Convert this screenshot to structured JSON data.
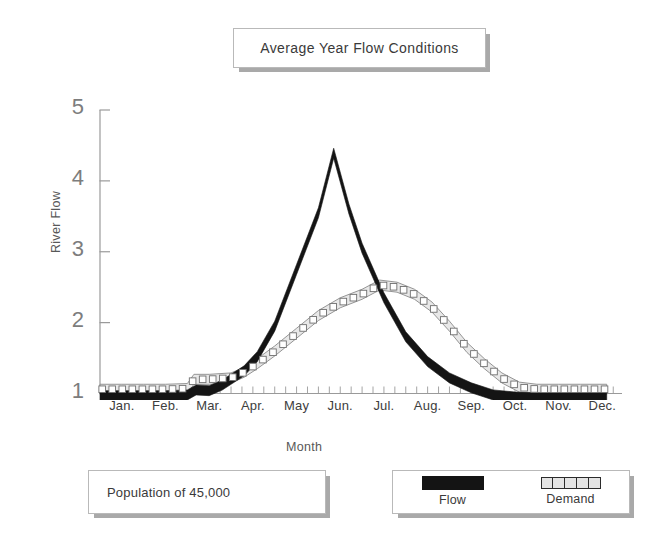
{
  "title": {
    "text": "Average Year Flow Conditions"
  },
  "population": {
    "text": "Population of 45,000"
  },
  "legend": {
    "flow_label": "Flow",
    "demand_label": "Demand"
  },
  "axes": {
    "ylabel": "River Flow",
    "xlabel": "Month"
  },
  "colors": {
    "flow": "#141414",
    "demand_fill": "#e8e8e8",
    "demand_stroke": "#8a8a8a",
    "marker_fill": "#ffffff",
    "marker_stroke": "#6f6f6f",
    "axis": "#9a9a9a",
    "text": "#3a3a3a",
    "tick_text": "#7d7d7d",
    "box_border": "#b9b9b9",
    "box_shadow": "#a9a9a9"
  },
  "chart_data": {
    "type": "line",
    "title": "Average Year Flow Conditions",
    "xlabel": "Month",
    "ylabel": "River Flow",
    "grid": false,
    "legend_position": "bottom-right",
    "categories": [
      "Jan.",
      "Feb.",
      "Mar.",
      "Apr.",
      "May",
      "Jun.",
      "Jul.",
      "Aug.",
      "Sep.",
      "Oct.",
      "Nov.",
      "Dec."
    ],
    "yticks": [
      1,
      2,
      3,
      4,
      5
    ],
    "ylim": [
      0.85,
      5
    ],
    "xlim": [
      0,
      12
    ],
    "minor_ticks_per_month": 4,
    "series": [
      {
        "name": "Flow",
        "style": "solid-black-band",
        "values": [
          0.97,
          0.97,
          1.02,
          1.3,
          2.6,
          4.1,
          2.55,
          1.55,
          1.12,
          0.95,
          0.95,
          0.95
        ],
        "points": [
          [
            0.0,
            0.97
          ],
          [
            0.5,
            0.97
          ],
          [
            1.0,
            0.97
          ],
          [
            1.5,
            0.97
          ],
          [
            2.0,
            0.98
          ],
          [
            2.2,
            1.05
          ],
          [
            2.5,
            1.04
          ],
          [
            2.8,
            1.12
          ],
          [
            3.0,
            1.2
          ],
          [
            3.3,
            1.32
          ],
          [
            3.6,
            1.52
          ],
          [
            4.0,
            1.95
          ],
          [
            4.5,
            2.75
          ],
          [
            5.0,
            3.55
          ],
          [
            5.35,
            4.39
          ],
          [
            5.7,
            3.6
          ],
          [
            6.0,
            3.05
          ],
          [
            6.5,
            2.35
          ],
          [
            7.0,
            1.8
          ],
          [
            7.5,
            1.45
          ],
          [
            8.0,
            1.22
          ],
          [
            8.5,
            1.08
          ],
          [
            9.0,
            0.98
          ],
          [
            9.5,
            0.95
          ],
          [
            10.0,
            0.94
          ],
          [
            10.5,
            0.94
          ],
          [
            11.0,
            0.94
          ],
          [
            11.6,
            0.94
          ]
        ],
        "peak": {
          "month": "Jun.",
          "value": 4.39
        }
      },
      {
        "name": "Demand",
        "style": "light-band-with-square-markers",
        "values": [
          1.06,
          1.06,
          1.2,
          1.38,
          1.95,
          2.38,
          2.53,
          2.3,
          1.55,
          1.07,
          1.06,
          1.06
        ],
        "points": [
          [
            0.0,
            1.06
          ],
          [
            0.5,
            1.06
          ],
          [
            1.0,
            1.06
          ],
          [
            1.5,
            1.06
          ],
          [
            2.0,
            1.07
          ],
          [
            2.15,
            1.2
          ],
          [
            2.5,
            1.2
          ],
          [
            3.0,
            1.22
          ],
          [
            3.3,
            1.3
          ],
          [
            3.6,
            1.42
          ],
          [
            4.0,
            1.6
          ],
          [
            4.5,
            1.85
          ],
          [
            5.0,
            2.1
          ],
          [
            5.5,
            2.28
          ],
          [
            6.0,
            2.4
          ],
          [
            6.4,
            2.53
          ],
          [
            6.8,
            2.5
          ],
          [
            7.2,
            2.4
          ],
          [
            7.6,
            2.22
          ],
          [
            8.0,
            1.95
          ],
          [
            8.4,
            1.65
          ],
          [
            8.8,
            1.42
          ],
          [
            9.2,
            1.22
          ],
          [
            9.6,
            1.09
          ],
          [
            10.0,
            1.06
          ],
          [
            10.5,
            1.06
          ],
          [
            11.0,
            1.06
          ],
          [
            11.6,
            1.06
          ]
        ],
        "peak": {
          "month": "Jul.",
          "value": 2.53
        }
      }
    ],
    "annotations": [
      {
        "name": "population",
        "text": "Population of 45,000"
      }
    ]
  }
}
